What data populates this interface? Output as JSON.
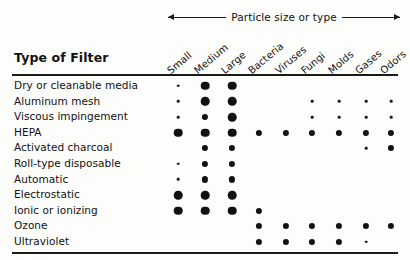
{
  "caption": {
    "text": "Particle size or type",
    "left_arrow": "arrow-left-icon",
    "right_arrow": "arrow-right-icon"
  },
  "table_title": "Type of Filter",
  "chart_data": {
    "type": "table",
    "title": "Type of Filter",
    "xlabel": "Particle size or type",
    "ylabel": "Type of Filter",
    "legend": [
      {
        "symbol": "lg",
        "meaning": "large dot"
      },
      {
        "symbol": "md",
        "meaning": "medium dot"
      },
      {
        "symbol": "sm",
        "meaning": "small dot"
      }
    ],
    "categories": [
      "Small",
      "Medium",
      "Large",
      "Bacteria",
      "Viruses",
      "Fungi",
      "Molds",
      "Gases",
      "Odors"
    ],
    "rows": [
      {
        "label": "Dry or cleanable media",
        "values": [
          "sm",
          "lg",
          "lg",
          "",
          "",
          "",
          "",
          "",
          ""
        ]
      },
      {
        "label": "Aluminum mesh",
        "values": [
          "sm",
          "lg",
          "lg",
          "",
          "",
          "sm",
          "sm",
          "sm",
          "sm"
        ]
      },
      {
        "label": "Viscous impingement",
        "values": [
          "sm",
          "md",
          "lg",
          "",
          "",
          "sm",
          "sm",
          "sm",
          "sm"
        ]
      },
      {
        "label": "HEPA",
        "values": [
          "lg",
          "lg",
          "lg",
          "md",
          "md",
          "md",
          "md",
          "md",
          "md"
        ]
      },
      {
        "label": "Activated charcoal",
        "values": [
          "",
          "md",
          "md",
          "",
          "",
          "",
          "",
          "sm",
          "md"
        ]
      },
      {
        "label": "Roll-type disposable",
        "values": [
          "sm",
          "md",
          "md",
          "",
          "",
          "",
          "",
          "",
          ""
        ]
      },
      {
        "label": "Automatic",
        "values": [
          "sm",
          "md",
          "md",
          "",
          "",
          "",
          "",
          "",
          ""
        ]
      },
      {
        "label": "Electrostatic",
        "values": [
          "lg",
          "lg",
          "lg",
          "",
          "",
          "",
          "",
          "",
          ""
        ]
      },
      {
        "label": "Ionic or ionizing",
        "values": [
          "lg",
          "lg",
          "lg",
          "md",
          "",
          "",
          "",
          "",
          ""
        ]
      },
      {
        "label": "Ozone",
        "values": [
          "",
          "",
          "",
          "md",
          "md",
          "md",
          "md",
          "md",
          "md"
        ]
      },
      {
        "label": "Ultraviolet",
        "values": [
          "",
          "",
          "",
          "md",
          "md",
          "md",
          "md",
          "sm",
          ""
        ]
      }
    ]
  },
  "layout": {
    "column_x": [
      178,
      205,
      232,
      259,
      286,
      312,
      339,
      366,
      391
    ],
    "row_height": 15.6,
    "accent_color": "#111111"
  }
}
